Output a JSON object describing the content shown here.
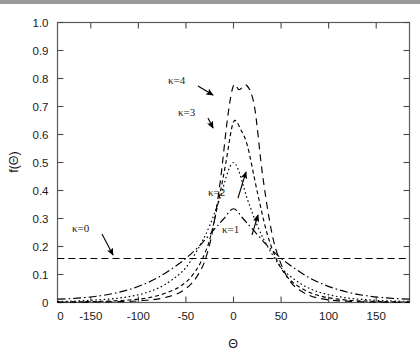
{
  "chart_data": {
    "type": "line",
    "title": "",
    "xlabel": "Θ",
    "ylabel": "f(Θ)",
    "xlim": [
      -185,
      185
    ],
    "ylim": [
      0,
      1.0
    ],
    "grid": false,
    "legend_position": "inline-annotations",
    "xticks": [
      -150,
      -100,
      -50,
      0,
      50,
      100,
      150
    ],
    "xticklabels": [
      "-150",
      "-100",
      "-50",
      "0",
      "50",
      "100",
      "150"
    ],
    "extra_xtick_label": "0",
    "yticks": [
      0,
      0.1,
      0.2,
      0.3,
      0.4,
      0.5,
      0.6,
      0.7,
      0.8,
      0.9,
      1.0
    ],
    "yticklabels": [
      "0",
      "0.1",
      "0.2",
      "0.3",
      "0.4",
      "0.5",
      "0.6",
      "0.7",
      "0.8",
      "0.9",
      "1.0"
    ],
    "series": [
      {
        "name": "κ=0",
        "label": "κ=0",
        "linestyle": "dashed",
        "color": "#000000",
        "peak": 0.157,
        "x": [
          -185,
          -150,
          -100,
          -50,
          0,
          50,
          100,
          150,
          185
        ],
        "values": [
          0.157,
          0.157,
          0.157,
          0.157,
          0.157,
          0.157,
          0.157,
          0.157,
          0.157
        ]
      },
      {
        "name": "κ=1",
        "label": "κ=1",
        "linestyle": "dashdot",
        "color": "#000000",
        "peak": 0.335,
        "x": [
          -185,
          -170,
          -155,
          -140,
          -125,
          -110,
          -95,
          -80,
          -65,
          -50,
          -35,
          -20,
          -10,
          0,
          10,
          20,
          35,
          50,
          65,
          80,
          95,
          110,
          125,
          140,
          155,
          170,
          185
        ],
        "values": [
          0.012,
          0.014,
          0.018,
          0.024,
          0.033,
          0.046,
          0.064,
          0.088,
          0.12,
          0.158,
          0.205,
          0.262,
          0.3,
          0.335,
          0.3,
          0.262,
          0.205,
          0.158,
          0.12,
          0.088,
          0.064,
          0.046,
          0.033,
          0.024,
          0.018,
          0.014,
          0.012
        ]
      },
      {
        "name": "κ=2",
        "label": "κ=2",
        "linestyle": "dotted",
        "color": "#000000",
        "peak": 0.5,
        "x": [
          -185,
          -170,
          -155,
          -140,
          -125,
          -110,
          -95,
          -80,
          -65,
          -50,
          -35,
          -25,
          -15,
          0,
          15,
          25,
          35,
          50,
          65,
          80,
          95,
          110,
          125,
          140,
          155,
          170,
          185
        ],
        "values": [
          0.004,
          0.005,
          0.007,
          0.01,
          0.014,
          0.021,
          0.032,
          0.05,
          0.08,
          0.125,
          0.205,
          0.275,
          0.365,
          0.5,
          0.365,
          0.275,
          0.205,
          0.125,
          0.08,
          0.05,
          0.032,
          0.021,
          0.014,
          0.01,
          0.007,
          0.005,
          0.004
        ]
      },
      {
        "name": "κ=3",
        "label": "κ=3",
        "linestyle": "dashed-fine",
        "color": "#000000",
        "peak": 0.645,
        "bimodal": true,
        "x": [
          -185,
          -170,
          -155,
          -140,
          -125,
          -110,
          -95,
          -80,
          -65,
          -55,
          -45,
          -35,
          -25,
          -15,
          -8,
          0,
          8,
          15,
          25,
          35,
          45,
          55,
          65,
          80,
          95,
          110,
          125,
          140,
          155,
          170,
          185
        ],
        "values": [
          0.002,
          0.002,
          0.003,
          0.004,
          0.006,
          0.009,
          0.014,
          0.024,
          0.042,
          0.06,
          0.09,
          0.14,
          0.225,
          0.375,
          0.5,
          0.645,
          0.615,
          0.555,
          0.395,
          0.25,
          0.155,
          0.098,
          0.065,
          0.036,
          0.02,
          0.012,
          0.007,
          0.005,
          0.003,
          0.002,
          0.002
        ]
      },
      {
        "name": "κ=4",
        "label": "κ=4",
        "linestyle": "dashed-long",
        "color": "#000000",
        "peak": 0.775,
        "bimodal": true,
        "x": [
          -185,
          -170,
          -155,
          -140,
          -125,
          -110,
          -95,
          -80,
          -65,
          -55,
          -45,
          -38,
          -30,
          -22,
          -14,
          -6,
          0,
          6,
          14,
          22,
          30,
          38,
          45,
          55,
          65,
          80,
          95,
          110,
          125,
          140,
          155,
          170,
          185
        ],
        "values": [
          0.001,
          0.001,
          0.0015,
          0.002,
          0.003,
          0.004,
          0.007,
          0.012,
          0.024,
          0.038,
          0.065,
          0.095,
          0.15,
          0.255,
          0.43,
          0.665,
          0.775,
          0.76,
          0.775,
          0.7,
          0.47,
          0.29,
          0.185,
          0.1,
          0.055,
          0.025,
          0.012,
          0.006,
          0.004,
          0.002,
          0.0015,
          0.001,
          0.001
        ]
      }
    ],
    "annotations": [
      {
        "label": "κ=4",
        "text_x": 168,
        "text_y": 84,
        "arrow_to_x": 213,
        "arrow_to_y": 95
      },
      {
        "label": "κ=3",
        "text_x": 178,
        "text_y": 116,
        "arrow_to_x": 213,
        "arrow_to_y": 128
      },
      {
        "label": "κ=2",
        "text_x": 208,
        "text_y": 196,
        "arrow_to_x": 246,
        "arrow_to_y": 172
      },
      {
        "label": "κ=1",
        "text_x": 222,
        "text_y": 233,
        "arrow_to_x": 258,
        "arrow_to_y": 215
      },
      {
        "label": "κ=0",
        "text_x": 72,
        "text_y": 232,
        "arrow_to_x": 113,
        "arrow_to_y": 255
      }
    ]
  }
}
